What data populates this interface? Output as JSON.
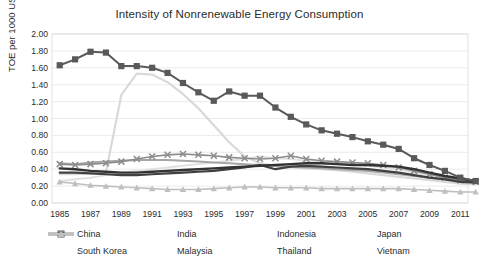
{
  "chart_data": {
    "type": "line",
    "title": "Intensity of Nonrenewable  Energy Consumption",
    "xlabel": "",
    "ylabel": "TOE per 1000 USD",
    "ylim": [
      0.0,
      2.0
    ],
    "ytick_step": 0.2,
    "yticks": [
      "0.00",
      "0.20",
      "0.40",
      "0.60",
      "0.80",
      "1.00",
      "1.20",
      "1.40",
      "1.60",
      "1.80",
      "2.00"
    ],
    "xlim": [
      1985,
      2012
    ],
    "xticks": [
      "1985",
      "1987",
      "1989",
      "1991",
      "1993",
      "1995",
      "1997",
      "1999",
      "2001",
      "2003",
      "2005",
      "2007",
      "2009",
      "2011"
    ],
    "x": [
      1985,
      1986,
      1987,
      1988,
      1989,
      1990,
      1991,
      1992,
      1993,
      1994,
      1995,
      1996,
      1997,
      1998,
      1999,
      2000,
      2001,
      2002,
      2003,
      2004,
      2005,
      2006,
      2007,
      2008,
      2009,
      2010,
      2011,
      2012
    ],
    "grid": true,
    "legend_position": "bottom",
    "series": [
      {
        "name": "China",
        "color": "#595959",
        "marker": "square",
        "width": 2.0,
        "values": [
          1.63,
          1.7,
          1.79,
          1.78,
          1.62,
          1.62,
          1.6,
          1.54,
          1.42,
          1.31,
          1.21,
          1.32,
          1.27,
          1.27,
          1.13,
          1.02,
          0.93,
          0.86,
          0.82,
          0.78,
          0.73,
          0.69,
          0.64,
          0.53,
          0.45,
          0.38,
          0.3,
          0.26
        ]
      },
      {
        "name": "India",
        "color": "#a6a6a6",
        "marker": "none",
        "width": 2.0,
        "values": [
          0.47,
          0.46,
          0.48,
          0.49,
          0.5,
          0.51,
          0.51,
          0.51,
          0.5,
          0.49,
          0.48,
          0.47,
          0.46,
          0.45,
          0.44,
          0.43,
          0.42,
          0.41,
          0.4,
          0.39,
          0.38,
          0.36,
          0.34,
          0.32,
          0.3,
          0.28,
          0.26,
          0.25
        ]
      },
      {
        "name": "Indonesia",
        "color": "#d9d9d9",
        "marker": "none",
        "width": 2.2,
        "values": [
          0.34,
          0.34,
          0.35,
          0.36,
          1.28,
          1.53,
          1.52,
          1.43,
          1.29,
          1.12,
          0.92,
          0.72,
          0.55,
          0.47,
          0.44,
          0.42,
          0.41,
          0.4,
          0.39,
          0.37,
          0.35,
          0.33,
          0.31,
          0.29,
          0.27,
          0.25,
          0.23,
          0.22
        ]
      },
      {
        "name": "Japan",
        "color": "#8c8c8c",
        "marker": "cross",
        "width": 1.6,
        "values": [
          0.46,
          0.45,
          0.46,
          0.47,
          0.49,
          0.52,
          0.55,
          0.57,
          0.58,
          0.57,
          0.56,
          0.54,
          0.53,
          0.52,
          0.53,
          0.56,
          0.52,
          0.5,
          0.49,
          0.48,
          0.47,
          0.45,
          0.42,
          0.38,
          0.34,
          0.3,
          0.27,
          0.25
        ]
      },
      {
        "name": "South Korea",
        "color": "#404040",
        "marker": "none",
        "width": 2.2,
        "values": [
          0.36,
          0.36,
          0.35,
          0.34,
          0.33,
          0.33,
          0.34,
          0.35,
          0.36,
          0.37,
          0.38,
          0.4,
          0.42,
          0.45,
          0.4,
          0.43,
          0.44,
          0.43,
          0.42,
          0.41,
          0.4,
          0.38,
          0.36,
          0.33,
          0.3,
          0.28,
          0.25,
          0.24
        ]
      },
      {
        "name": "Malaysia",
        "color": "#e0e0e0",
        "marker": "none",
        "width": 2.0,
        "values": [
          0.26,
          0.28,
          0.3,
          0.33,
          0.36,
          0.38,
          0.4,
          0.42,
          0.44,
          0.46,
          0.48,
          0.5,
          0.52,
          0.55,
          0.53,
          0.52,
          0.5,
          0.49,
          0.48,
          0.46,
          0.44,
          0.42,
          0.4,
          0.36,
          0.33,
          0.3,
          0.27,
          0.25
        ]
      },
      {
        "name": "Thailand",
        "color": "#333333",
        "marker": "none",
        "width": 2.4,
        "values": [
          0.41,
          0.4,
          0.38,
          0.37,
          0.36,
          0.36,
          0.37,
          0.38,
          0.39,
          0.4,
          0.41,
          0.42,
          0.43,
          0.44,
          0.45,
          0.46,
          0.47,
          0.47,
          0.46,
          0.45,
          0.45,
          0.44,
          0.43,
          0.4,
          0.36,
          0.32,
          0.29,
          0.26
        ]
      },
      {
        "name": "Vietnam",
        "color": "#bfbfbf",
        "marker": "triangle",
        "width": 1.6,
        "values": [
          0.25,
          0.23,
          0.21,
          0.2,
          0.19,
          0.18,
          0.17,
          0.16,
          0.16,
          0.16,
          0.17,
          0.18,
          0.19,
          0.19,
          0.18,
          0.18,
          0.18,
          0.17,
          0.17,
          0.17,
          0.17,
          0.17,
          0.17,
          0.16,
          0.15,
          0.14,
          0.13,
          0.13
        ]
      }
    ]
  },
  "legend": {
    "row1": [
      "China",
      "India",
      "Indonesia",
      "Japan"
    ],
    "row2": [
      "South Korea",
      "Malaysia",
      "Thailand",
      "Vietnam"
    ]
  }
}
